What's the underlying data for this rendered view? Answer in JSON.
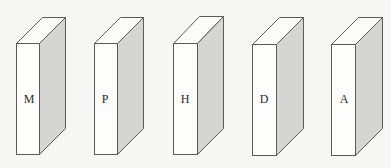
{
  "diagram": {
    "type": "row-of-3d-boxes",
    "box_count": 5,
    "colors": {
      "background": "#f6f6f5",
      "front_face": "#fdfdfc",
      "top_face": "#fbfbfa",
      "side_face": "#d5d5d4",
      "outline": "#5a5a5a",
      "label": "#2a2a2a"
    },
    "boxes": [
      {
        "label": "M"
      },
      {
        "label": "P"
      },
      {
        "label": "H"
      },
      {
        "label": "D"
      },
      {
        "label": "A"
      }
    ]
  }
}
